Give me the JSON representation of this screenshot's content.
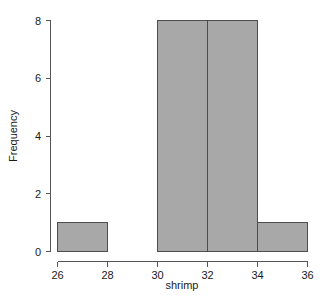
{
  "chart_data": {
    "type": "bar",
    "subtype": "histogram",
    "title": "",
    "xlabel": "shrimp",
    "ylabel": "Frequency",
    "xlim": [
      26,
      36
    ],
    "ylim": [
      0,
      8
    ],
    "grid": false,
    "legend": null,
    "bin_width": 2,
    "bin_edges": [
      26,
      28,
      30,
      32,
      34,
      36
    ],
    "categories": [
      "26-28",
      "28-30",
      "30-32",
      "32-34",
      "34-36"
    ],
    "values": [
      1,
      0,
      8,
      8,
      1
    ],
    "bars": [
      {
        "label": "26-28",
        "x0": 26,
        "x1": 28,
        "value": 1
      },
      {
        "label": "28-30",
        "x0": 28,
        "x1": 30,
        "value": 0
      },
      {
        "label": "30-32",
        "x0": 30,
        "x1": 32,
        "value": 8
      },
      {
        "label": "32-34",
        "x0": 32,
        "x1": 34,
        "value": 8
      },
      {
        "label": "34-36",
        "x0": 34,
        "x1": 36,
        "value": 1
      }
    ],
    "x_ticks": [
      26,
      28,
      30,
      32,
      34,
      36
    ],
    "x_tick_labels": [
      "26",
      "28",
      "30",
      "32",
      "34",
      "36"
    ],
    "y_ticks": [
      0,
      2,
      4,
      6,
      8
    ],
    "y_tick_labels": [
      "0",
      "2",
      "4",
      "6",
      "8"
    ],
    "colors": {
      "bar_fill": "#a8a8a8",
      "bar_border": "#4d4d4d",
      "axis": "#555555",
      "text": "#1a1a1a",
      "background": "#ffffff"
    }
  }
}
